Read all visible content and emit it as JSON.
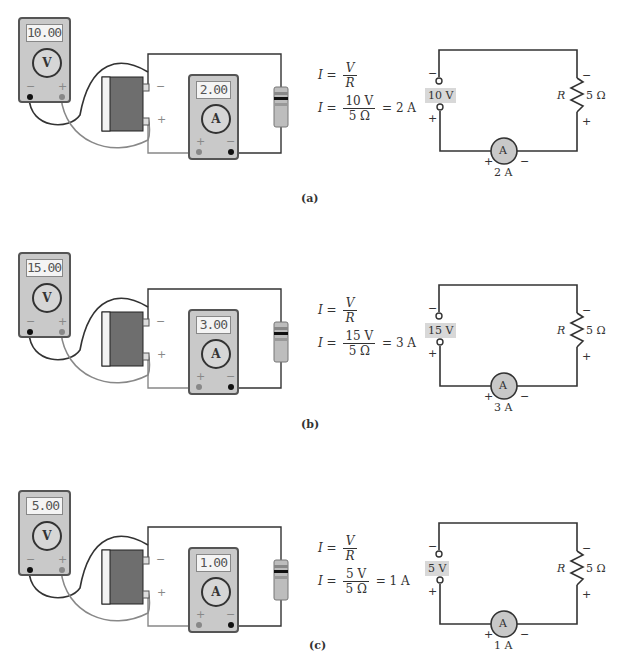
{
  "panels": [
    {
      "caption": "(a)",
      "voltmeter": {
        "reading": "10.00",
        "dial": "V",
        "neg": "−",
        "pos": "+"
      },
      "ammeter": {
        "reading": "2.00",
        "dial": "A",
        "neg": "−",
        "pos": "+"
      },
      "battery": {
        "neg": "−",
        "pos": "+"
      },
      "equation": {
        "lhs": "I",
        "eq": "=",
        "num1": "V",
        "den1": "R",
        "num2": "10 V",
        "den2": "5 Ω",
        "result": "= 2 A"
      },
      "schematic": {
        "source": "10 V",
        "src_neg": "−",
        "src_pos": "+",
        "r_label": "R",
        "r_value": "5 Ω",
        "r_neg": "−",
        "r_pos": "+",
        "meter": "A",
        "m_pos": "+",
        "m_neg": "−",
        "current": "2 A"
      }
    },
    {
      "caption": "(b)",
      "voltmeter": {
        "reading": "15.00",
        "dial": "V",
        "neg": "−",
        "pos": "+"
      },
      "ammeter": {
        "reading": "3.00",
        "dial": "A",
        "neg": "−",
        "pos": "+"
      },
      "battery": {
        "neg": "−",
        "pos": "+"
      },
      "equation": {
        "lhs": "I",
        "eq": "=",
        "num1": "V",
        "den1": "R",
        "num2": "15 V",
        "den2": "5 Ω",
        "result": "= 3 A"
      },
      "schematic": {
        "source": "15 V",
        "src_neg": "−",
        "src_pos": "+",
        "r_label": "R",
        "r_value": "5 Ω",
        "r_neg": "−",
        "r_pos": "+",
        "meter": "A",
        "m_pos": "+",
        "m_neg": "−",
        "current": "3 A"
      }
    },
    {
      "caption": "(c)",
      "voltmeter": {
        "reading": "5.00",
        "dial": "V",
        "neg": "−",
        "pos": "+"
      },
      "ammeter": {
        "reading": "1.00",
        "dial": "A",
        "neg": "−",
        "pos": "+"
      },
      "battery": {
        "neg": "−",
        "pos": "+"
      },
      "equation": {
        "lhs": "I",
        "eq": "=",
        "num1": "V",
        "den1": "R",
        "num2": "5 V",
        "den2": "5 Ω",
        "result": "= 1 A"
      },
      "schematic": {
        "source": "5 V",
        "src_neg": "−",
        "src_pos": "+",
        "r_label": "R",
        "r_value": "5 Ω",
        "r_neg": "−",
        "r_pos": "+",
        "meter": "A",
        "m_pos": "+",
        "m_neg": "−",
        "current": "1 A"
      }
    }
  ]
}
